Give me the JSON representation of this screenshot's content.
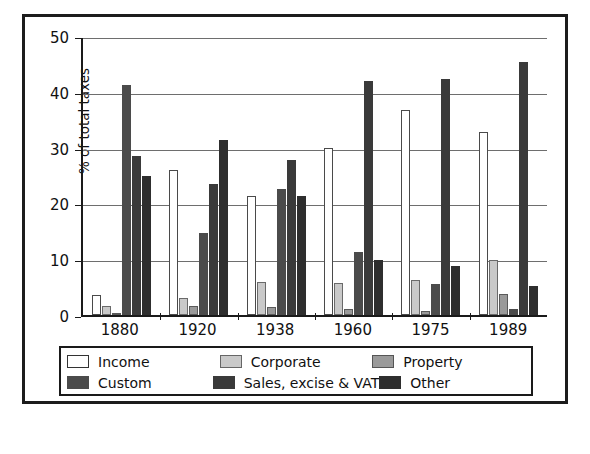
{
  "figure": {
    "border_color": "#1c1c1c",
    "background": "#ffffff"
  },
  "chart_data": {
    "type": "bar",
    "title": "",
    "xlabel": "",
    "ylabel": "% of total taxes",
    "ylim": [
      0,
      50
    ],
    "yticks": [
      0,
      10,
      20,
      30,
      40,
      50
    ],
    "ytick_labels": [
      "0",
      "10",
      "20",
      "30",
      "40",
      "50"
    ],
    "grid": true,
    "grid_axis": "y",
    "legend_position": "bottom",
    "legend_columns": 3,
    "categories": [
      "1880",
      "1920",
      "1938",
      "1960",
      "1975",
      "1989"
    ],
    "series": [
      {
        "name": "Income",
        "color": "#ffffff",
        "values": [
          3.5,
          26.0,
          21.3,
          30.0,
          36.7,
          32.8
        ]
      },
      {
        "name": "Corporate",
        "color": "#c9c9c9",
        "values": [
          1.6,
          3.0,
          6.0,
          5.8,
          6.3,
          9.8
        ]
      },
      {
        "name": "Property",
        "color": "#9a9a9a",
        "values": [
          0.0,
          1.7,
          1.5,
          1.0,
          0.8,
          3.8
        ]
      },
      {
        "name": "Custom",
        "color": "#4b4b4b",
        "values": [
          41.3,
          14.7,
          22.5,
          11.3,
          5.5,
          1.0
        ]
      },
      {
        "name": "Sales, excise & VAT",
        "color": "#3a3a3a",
        "values": [
          28.5,
          23.5,
          27.8,
          42.0,
          42.3,
          45.3
        ]
      },
      {
        "name": "Other",
        "color": "#2e2e2e",
        "values": [
          25.0,
          31.3,
          21.3,
          9.8,
          8.8,
          5.2
        ]
      }
    ]
  },
  "legend": {
    "items": [
      {
        "label": "Income"
      },
      {
        "label": "Corporate"
      },
      {
        "label": "Property"
      },
      {
        "label": "Custom"
      },
      {
        "label": "Sales, excise & VAT"
      },
      {
        "label": "Other"
      }
    ]
  }
}
